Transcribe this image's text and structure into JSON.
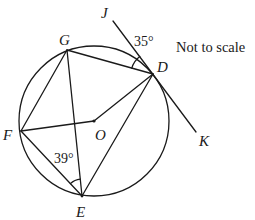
{
  "note": "Not to scale",
  "circle": {
    "center_label": "O",
    "cx": 94,
    "cy": 121,
    "r": 75
  },
  "points": {
    "G": {
      "label": "G",
      "x": 67,
      "y": 50
    },
    "D": {
      "label": "D",
      "x": 153,
      "y": 74
    },
    "F": {
      "label": "F",
      "x": 21,
      "y": 131
    },
    "E": {
      "label": "E",
      "x": 82,
      "y": 196
    },
    "O": {
      "label": "O",
      "x": 94,
      "y": 121
    },
    "J": {
      "label": "J",
      "x": 113,
      "y": 21
    },
    "K": {
      "label": "K",
      "x": 196,
      "y": 132
    }
  },
  "segments": [
    "GD",
    "GF",
    "GE",
    "FO",
    "OD",
    "FE",
    "ED",
    "JK"
  ],
  "angles": {
    "angle_JDG": {
      "label": "35°",
      "vertex": "D",
      "between": [
        "DJ",
        "DG"
      ]
    },
    "angle_FEG": {
      "label": "39°",
      "vertex": "E",
      "between": [
        "EF",
        "EG"
      ]
    }
  },
  "tangent": {
    "line": "JK",
    "touches_at": "D"
  }
}
